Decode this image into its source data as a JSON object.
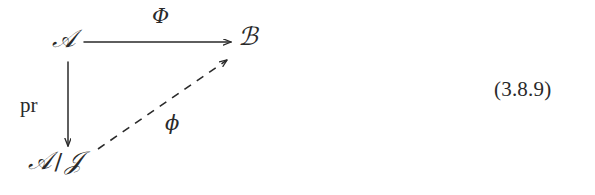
{
  "figure": {
    "kind": "commutative-diagram",
    "equation_number": "(3.8.9)",
    "ink_color": "#2a2a2a",
    "background_color": "#ffffff",
    "nodes": [
      {
        "id": "a",
        "label": "ℬ-source",
        "text": "𝒜",
        "x": 62,
        "y": 42
      },
      {
        "id": "b",
        "label": "target",
        "text": "ℬ",
        "x": 248,
        "y": 40
      },
      {
        "id": "a-quotient",
        "label": "quotient",
        "text": "𝒜",
        "x": 48,
        "y": 166,
        "slash": "/",
        "denominator": "𝒥"
      }
    ],
    "edges": [
      {
        "id": "phi-upper",
        "from": "a",
        "to": "b",
        "label": "Φ",
        "style": "solid",
        "x1": 84,
        "y1": 42,
        "x2": 233,
        "y2": 42
      },
      {
        "id": "pr",
        "from": "a",
        "to": "a-quotient",
        "label": "pr",
        "style": "solid",
        "x1": 68,
        "y1": 62,
        "x2": 68,
        "y2": 148
      },
      {
        "id": "phi-lower",
        "from": "a-quotient",
        "to": "b",
        "label": "ϕ",
        "style": "dashed",
        "x1": 98,
        "y1": 149,
        "x2": 229,
        "y2": 58
      }
    ]
  }
}
